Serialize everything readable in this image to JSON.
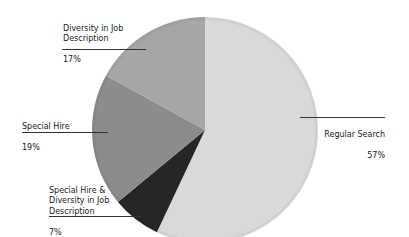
{
  "chart_data": {
    "type": "pie",
    "title": "",
    "start_angle_deg": 0,
    "direction": "clockwise",
    "series": [
      {
        "name": "Regular Search",
        "value": 57,
        "label": "Regular Search",
        "pct_label": "57%",
        "color": "#d9d9d9"
      },
      {
        "name": "Special Hire & Diversity in Job Description",
        "value": 7,
        "label": "Special Hire &\nDiversity in Job\nDescription",
        "pct_label": "7%",
        "color": "#262626"
      },
      {
        "name": "Special Hire",
        "value": 19,
        "label": "Special Hire",
        "pct_label": "19%",
        "color": "#8c8c8c"
      },
      {
        "name": "Diversity in Job Description",
        "value": 17,
        "label": "Diversity in Job\nDescription",
        "pct_label": "17%",
        "color": "#a6a6a6"
      }
    ],
    "categories": [
      "Regular Search",
      "Special Hire & Diversity in Job Description",
      "Special Hire",
      "Diversity in Job Description"
    ],
    "values": [
      57,
      7,
      19,
      17
    ],
    "legend": "none (outside data labels with leader lines)"
  },
  "labels": {
    "regular": {
      "text": "Regular Search",
      "pct": "57%"
    },
    "shd": {
      "text": "Special Hire &\nDiversity in Job\nDescription",
      "pct": "7%"
    },
    "special": {
      "text": "Special Hire",
      "pct": "19%"
    },
    "diversity": {
      "text": "Diversity in Job\nDescription",
      "pct": "17%"
    }
  }
}
